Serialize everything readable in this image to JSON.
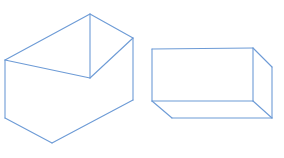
{
  "canvas": {
    "width": 284,
    "height": 158,
    "background_color": "#ffffff",
    "title": "Two wireframe rectangular boxes"
  },
  "style": {
    "line_color": "#6d9bd6",
    "line_color_soft": "#8fb2e0",
    "line_width": 1.1,
    "face_fill": "#ffffff"
  },
  "figures": [
    {
      "id": "left-box",
      "name": "left-rectangular-box",
      "description": "Wireframe cuboid seen from above-left, near vertical edge at center",
      "vertices": {
        "top_back_left": [
          5,
          60
        ],
        "top_apex_near": [
          90,
          14
        ],
        "top_right_far": [
          133,
          38
        ],
        "front_vertical_top": [
          90,
          14
        ],
        "front_vertical_bottom": [
          90,
          78
        ],
        "bottom_left": [
          5,
          118
        ],
        "bottom_apex_near": [
          52,
          143
        ],
        "bottom_right_far": [
          133,
          100
        ],
        "inner_corner": [
          90,
          78
        ]
      },
      "faces": {
        "top": [
          [
            5,
            60
          ],
          [
            90,
            14
          ],
          [
            133,
            38
          ],
          [
            90,
            78
          ]
        ],
        "left": [
          [
            5,
            60
          ],
          [
            90,
            78
          ],
          [
            52,
            143
          ],
          [
            5,
            118
          ]
        ],
        "right": [
          [
            90,
            78
          ],
          [
            133,
            38
          ],
          [
            133,
            100
          ],
          [
            52,
            143
          ]
        ]
      },
      "edges": [
        {
          "name": "top-back-left-edge",
          "from": [
            5,
            60
          ],
          "to": [
            90,
            14
          ]
        },
        {
          "name": "top-back-right-edge",
          "from": [
            90,
            14
          ],
          "to": [
            133,
            38
          ]
        },
        {
          "name": "top-front-left-edge",
          "from": [
            5,
            60
          ],
          "to": [
            90,
            78
          ]
        },
        {
          "name": "top-front-right-edge",
          "from": [
            90,
            78
          ],
          "to": [
            133,
            38
          ]
        },
        {
          "name": "near-vertical-edge",
          "from": [
            90,
            14
          ],
          "to": [
            90,
            78
          ]
        },
        {
          "name": "left-vertical-edge",
          "from": [
            5,
            60
          ],
          "to": [
            5,
            118
          ]
        },
        {
          "name": "right-vertical-edge",
          "from": [
            133,
            38
          ],
          "to": [
            133,
            100
          ]
        },
        {
          "name": "bottom-left-edge",
          "from": [
            5,
            118
          ],
          "to": [
            52,
            143
          ]
        },
        {
          "name": "bottom-right-edge",
          "from": [
            52,
            143
          ],
          "to": [
            133,
            100
          ]
        }
      ]
    },
    {
      "id": "right-box",
      "name": "right-rectangular-box",
      "description": "Wireframe cuboid seen from below-left, front face rectangular",
      "vertices": {
        "front_top_left": [
          152,
          49
        ],
        "front_top_right": [
          253,
          48
        ],
        "front_bottom_left": [
          152,
          101
        ],
        "front_bottom_right": [
          253,
          101
        ],
        "far_top_right": [
          272,
          67
        ],
        "far_bottom_right": [
          272,
          118
        ],
        "bottom_front_left": [
          172,
          118
        ],
        "bottom_front_right": [
          272,
          118
        ]
      },
      "faces": {
        "front": [
          [
            152,
            49
          ],
          [
            253,
            48
          ],
          [
            253,
            101
          ],
          [
            152,
            101
          ]
        ],
        "right_side": [
          [
            253,
            48
          ],
          [
            272,
            67
          ],
          [
            272,
            118
          ],
          [
            253,
            101
          ]
        ],
        "bottom": [
          [
            152,
            101
          ],
          [
            253,
            101
          ],
          [
            272,
            118
          ],
          [
            172,
            118
          ]
        ]
      },
      "edges": [
        {
          "name": "front-top-edge",
          "from": [
            152,
            49
          ],
          "to": [
            253,
            48
          ]
        },
        {
          "name": "front-left-edge",
          "from": [
            152,
            49
          ],
          "to": [
            152,
            101
          ]
        },
        {
          "name": "front-right-edge",
          "from": [
            253,
            48
          ],
          "to": [
            253,
            101
          ]
        },
        {
          "name": "front-bottom-edge",
          "from": [
            152,
            101
          ],
          "to": [
            253,
            101
          ]
        },
        {
          "name": "top-right-diagonal-edge",
          "from": [
            253,
            48
          ],
          "to": [
            272,
            67
          ]
        },
        {
          "name": "far-right-vertical-edge",
          "from": [
            272,
            67
          ],
          "to": [
            272,
            118
          ]
        },
        {
          "name": "bottom-right-diagonal-edge",
          "from": [
            253,
            101
          ],
          "to": [
            272,
            118
          ]
        },
        {
          "name": "bottom-left-diagonal-edge",
          "from": [
            152,
            101
          ],
          "to": [
            172,
            118
          ]
        },
        {
          "name": "bottom-front-edge",
          "from": [
            172,
            118
          ],
          "to": [
            272,
            118
          ]
        }
      ]
    }
  ]
}
